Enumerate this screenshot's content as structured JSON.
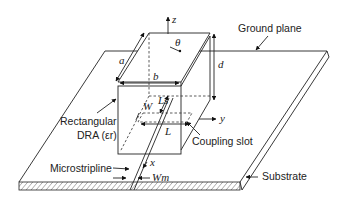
{
  "diagram": {
    "type": "antenna-schematic",
    "labels": {
      "ground_plane": "Ground plane",
      "rectangular_dra": "Rectangular",
      "rectangular_dra_line2": "DRA (εr)",
      "coupling_slot": "Coupling slot",
      "microstripline": "Microstripline",
      "substrate": "Substrate"
    },
    "dimensions": {
      "a": "a",
      "b": "b",
      "d": "d",
      "W": "W",
      "Ls": "Ls",
      "L": "L",
      "Wm": "Wm"
    },
    "axes": {
      "x": "x",
      "y": "y",
      "z": "z",
      "theta": "θ"
    },
    "colors": {
      "line": "#222222",
      "background": "#ffffff"
    }
  }
}
